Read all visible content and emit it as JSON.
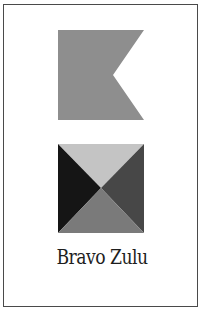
{
  "card": {
    "caption": "Bravo Zulu",
    "border_color": "#4a4a4a",
    "background": "#ffffff"
  },
  "flags": [
    {
      "name": "bravo",
      "icon": "swallowtail-flag-icon",
      "shape": "swallowtail",
      "color": "#8e8e8e"
    },
    {
      "name": "zulu",
      "icon": "quartered-triangle-flag-icon",
      "shape": "four-triangles",
      "colors": {
        "top": "#c4c4c4",
        "left": "#151515",
        "right": "#474747",
        "bottom": "#7a7a7a"
      }
    }
  ]
}
